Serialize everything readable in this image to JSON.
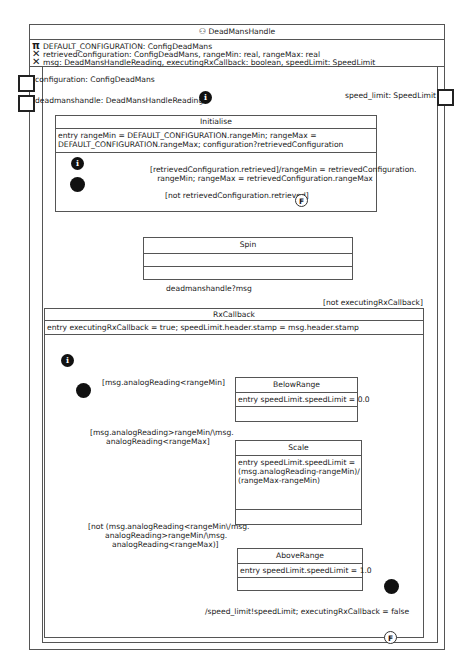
{
  "component": {
    "title": "DeadMansHandle",
    "title_icon": "state-machine-icon",
    "declarations": [
      {
        "icon": "constant-pi-icon",
        "glyph": "π",
        "text": "DEFAULT_CONFIGURATION: ConfigDeadMans"
      },
      {
        "icon": "variable-x-icon",
        "glyph": "✕",
        "text": "retrievedConfiguration: ConfigDeadMans, rangeMin: real, rangeMax: real"
      },
      {
        "icon": "variable-x-icon",
        "glyph": "✕",
        "text": "msg: DeadMansHandleReading, executingRxCallback: boolean, speedLimit: SpeedLimit"
      }
    ],
    "ports": {
      "in": [
        {
          "label": "configuration: ConfigDeadMans"
        },
        {
          "label": "deadmanshandle: DeadMansHandleReading"
        }
      ],
      "out": [
        {
          "label": "speed_limit: SpeedLimit"
        }
      ]
    }
  },
  "states": {
    "initialise": {
      "name": "Initialise",
      "entry_line1": "entry rangeMin = DEFAULT_CONFIGURATION.rangeMin; rangeMax =",
      "entry_line2": "DEFAULT_CONFIGURATION.rangeMax; configuration?retrievedConfiguration",
      "t_retrieved_line1": "[retrievedConfiguration.retrieved]/rangeMin = retrievedConfiguration.",
      "t_retrieved_line2": "rangeMin; rangeMax = retrievedConfiguration.rangeMax",
      "t_not_retrieved": "[not retrievedConfiguration.retrieved]"
    },
    "spin": {
      "name": "Spin"
    },
    "rxcallback": {
      "name": "RxCallback",
      "entry": "entry executingRxCallback = true; speedLimit.header.stamp = msg.header.stamp",
      "guard_below": "[msg.analogReading<rangeMin]",
      "guard_scale_line1": "[msg.analogReading>rangeMin/\\msg.",
      "guard_scale_line2": "analogReading<rangeMax]",
      "guard_above_line1": "[not (msg.analogReading<rangeMin\\/msg.",
      "guard_above_line2": "analogReading>rangeMin/\\msg.",
      "guard_above_line3": "analogReading<rangeMax)]",
      "exit_action": "/speed_limit!speedLimit; executingRxCallback = false"
    },
    "below_range": {
      "name": "BelowRange",
      "entry": "entry speedLimit.speedLimit = 0.0"
    },
    "scale": {
      "name": "Scale",
      "entry_line1": "entry speedLimit.speedLimit =",
      "entry_line2": "(msg.analogReading-rangeMin)/",
      "entry_line3": "(rangeMax-rangeMin)"
    },
    "above_range": {
      "name": "AboveRange",
      "entry": "entry speedLimit.speedLimit = 1.0"
    }
  },
  "transitions": {
    "spin_to_rx": "deadmanshandle?msg",
    "rx_to_spin": "[not executingRxCallback]"
  },
  "pseudostates": {
    "initial_glyph": "i",
    "final_glyph": "F"
  },
  "colors": {
    "line": "#555555",
    "node": "#111111",
    "background": "#ffffff"
  }
}
